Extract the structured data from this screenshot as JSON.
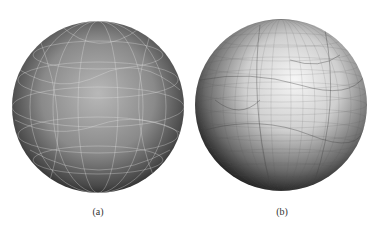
{
  "figure": {
    "panels": [
      {
        "id": "a",
        "label": "(a)",
        "description": "coarse quad mesh on sphere, light grid lines on dark shaded sphere"
      },
      {
        "id": "b",
        "label": "(b)",
        "description": "refined quad mesh on sphere, dark grid lines on light shaded sphere"
      }
    ],
    "colors": {
      "background": "#ffffff",
      "sphere_a_light": "#b4b4b4",
      "sphere_a_dark": "#1a1a1a",
      "sphere_a_lines": "#e6e6e6",
      "sphere_b_light": "#f4f4f4",
      "sphere_b_dark": "#1e1e1e",
      "sphere_b_lines": "#555555"
    }
  }
}
